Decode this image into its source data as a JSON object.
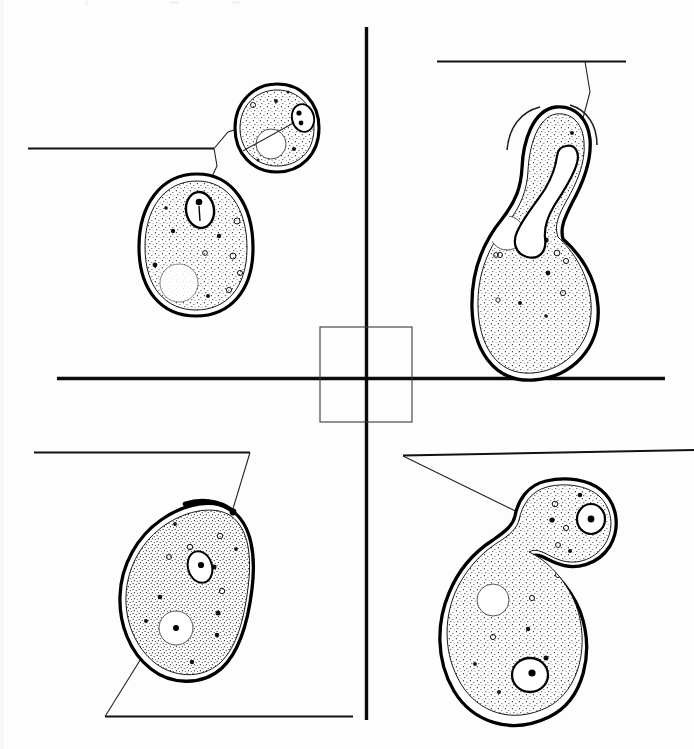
{
  "figure": {
    "background_color": "#fdfdfd",
    "ink_color": "#000000",
    "stipple_color": "#2a2a2a",
    "canvas": {
      "width": 694,
      "height": 749
    },
    "caption": ""
  },
  "axes": {
    "vertical_divider": {
      "name": "vertical-divider",
      "x1": 366.5,
      "y1": 27,
      "x2": 366.5,
      "y2": 720,
      "stroke_width": 3.4,
      "color": "#0a0a0a"
    },
    "horizontal_divider": {
      "name": "horizontal-divider",
      "x1": 57,
      "y1": 378.5,
      "x2": 665,
      "y2": 378.5,
      "stroke_width": 3.4,
      "color": "#0a0a0a"
    },
    "center_box": {
      "name": "center-box",
      "x": 320,
      "y": 327,
      "width": 92,
      "height": 95,
      "stroke_width": 1.1,
      "color": "#3a3a3a",
      "fill": "none"
    }
  },
  "quadrants": [
    {
      "id": "q1",
      "name": "quadrant-top-left",
      "position": "top-left",
      "stage_label": "",
      "description": "Unbudded G1 cell with single nucleus, shown at two magnifications",
      "cells": [
        "small-round-cell",
        "large-oval-cell"
      ],
      "organelles": [
        "nucleus",
        "vacuole",
        "cytoplasmic-granules"
      ]
    },
    {
      "id": "q2",
      "name": "quadrant-top-right",
      "position": "top-right",
      "stage_label": "",
      "description": "Budded cell with elongated dividing nucleus extending through bud neck",
      "cells": [
        "mother-with-elongated-bud"
      ],
      "organelles": [
        "elongated-nucleus",
        "vacuole",
        "cytoplasmic-granules",
        "bud-tip-arcs"
      ]
    },
    {
      "id": "q3",
      "name": "quadrant-bottom-left",
      "position": "bottom-left",
      "stage_label": "",
      "description": "Cell after cytokinesis showing bud scar and nucleus with vacuole",
      "cells": [
        "pear-shaped-cell"
      ],
      "organelles": [
        "nucleus",
        "vacuole",
        "bud-scar",
        "cytoplasmic-granules"
      ]
    },
    {
      "id": "q4",
      "name": "quadrant-bottom-right",
      "position": "bottom-right",
      "stage_label": "",
      "description": "Large budded cell after nuclear division, one nucleus in mother and one in daughter bud",
      "cells": [
        "mother-cell",
        "daughter-bud"
      ],
      "organelles": [
        "mother-nucleus",
        "daughter-nucleus",
        "vacuole",
        "cytoplasmic-granules"
      ]
    }
  ],
  "labels": [
    {
      "id": "label-q1",
      "name": "label-line-top-left",
      "text": "",
      "rule": {
        "x1": 28,
        "y1": 148.5,
        "x2": 214,
        "y2": 148.5
      },
      "leaders": [
        {
          "name": "leader-to-small-cell-nucleus",
          "points": "214,148.5 228,132 266,120"
        },
        {
          "name": "leader-to-large-cell-nucleus",
          "points": "214,148.5 217,166 201,200"
        }
      ]
    },
    {
      "id": "label-q2",
      "name": "label-line-top-right",
      "text": "",
      "rule": {
        "x1": 437,
        "y1": 61.5,
        "x2": 626,
        "y2": 61.5
      },
      "leaders": [
        {
          "name": "leader-to-bud-tip",
          "points": "585,61.5 590,92 582,122"
        }
      ]
    },
    {
      "id": "label-q3-top",
      "name": "label-line-bottom-left-upper",
      "text": "",
      "rule": {
        "x1": 34,
        "y1": 452.5,
        "x2": 250,
        "y2": 452.5
      },
      "leaders": [
        {
          "name": "leader-to-bud-scar",
          "points": "250,452.5 232,512"
        }
      ]
    },
    {
      "id": "label-q3-bottom",
      "name": "label-line-bottom-left-lower",
      "text": "",
      "rule": {
        "x1": 105,
        "y1": 716.5,
        "x2": 353,
        "y2": 716.5
      },
      "leaders": [
        {
          "name": "leader-to-vacuole",
          "points": "105,716.5 157,633"
        }
      ]
    },
    {
      "id": "label-q4",
      "name": "label-line-bottom-right",
      "text": "",
      "rule": {
        "x1": 403,
        "y1": 455.5,
        "x2": 694,
        "y2": 450
      },
      "leaders": [
        {
          "name": "leader-to-daughter-nucleus",
          "points": "403,456 540,523"
        }
      ]
    }
  ],
  "cells": {
    "small_round_cell": {
      "name": "small-round-cell",
      "center": [
        277,
        128
      ],
      "rx": 40,
      "ry": 42,
      "nucleus": {
        "cx": 304,
        "cy": 118,
        "rx": 10,
        "ry": 13,
        "dots": 2
      },
      "vacuole": {
        "cx": 270,
        "cy": 143,
        "r": 14
      }
    },
    "large_oval_cell": {
      "name": "large-oval-cell",
      "center": [
        196,
        245
      ],
      "rx": 54,
      "ry": 68,
      "nucleus": {
        "cx": 200,
        "cy": 210,
        "rx": 13,
        "ry": 17,
        "dots": 1
      },
      "vacuole": {
        "cx": 180,
        "cy": 283,
        "r": 18
      }
    },
    "budded_dividing_cell": {
      "name": "mother-with-elongated-bud",
      "mother_center": [
        535,
        250
      ],
      "mother_rx": 57,
      "mother_ry": 62,
      "bud_center": [
        580,
        140
      ],
      "nucleus_shape": "elongated-dumbbell",
      "vacuole": {
        "cx": 506,
        "cy": 232,
        "r": 16
      }
    },
    "pear_shaped_cell": {
      "name": "pear-shaped-cell",
      "center": [
        183,
        600
      ],
      "rx": 58,
      "ry": 72,
      "nucleus": {
        "cx": 200,
        "cy": 567,
        "rx": 11,
        "ry": 15,
        "dots": 1
      },
      "vacuole": {
        "cx": 176,
        "cy": 628,
        "r": 16
      },
      "bud_scar": {
        "cx": 233,
        "cy": 513
      }
    },
    "two_nucleus_cell": {
      "name": "mother-and-daughter-cell",
      "mother_center": [
        523,
        640
      ],
      "mother_rx": 56,
      "mother_ry": 70,
      "daughter_center": [
        575,
        520
      ],
      "daughter_rx": 42,
      "daughter_ry": 36,
      "mother_nucleus": {
        "cx": 530,
        "cy": 675,
        "rx": 17,
        "ry": 16
      },
      "daughter_nucleus": {
        "cx": 591,
        "cy": 519,
        "rx": 13,
        "ry": 14
      },
      "vacuole": {
        "cx": 493,
        "cy": 600,
        "r": 15
      }
    }
  }
}
